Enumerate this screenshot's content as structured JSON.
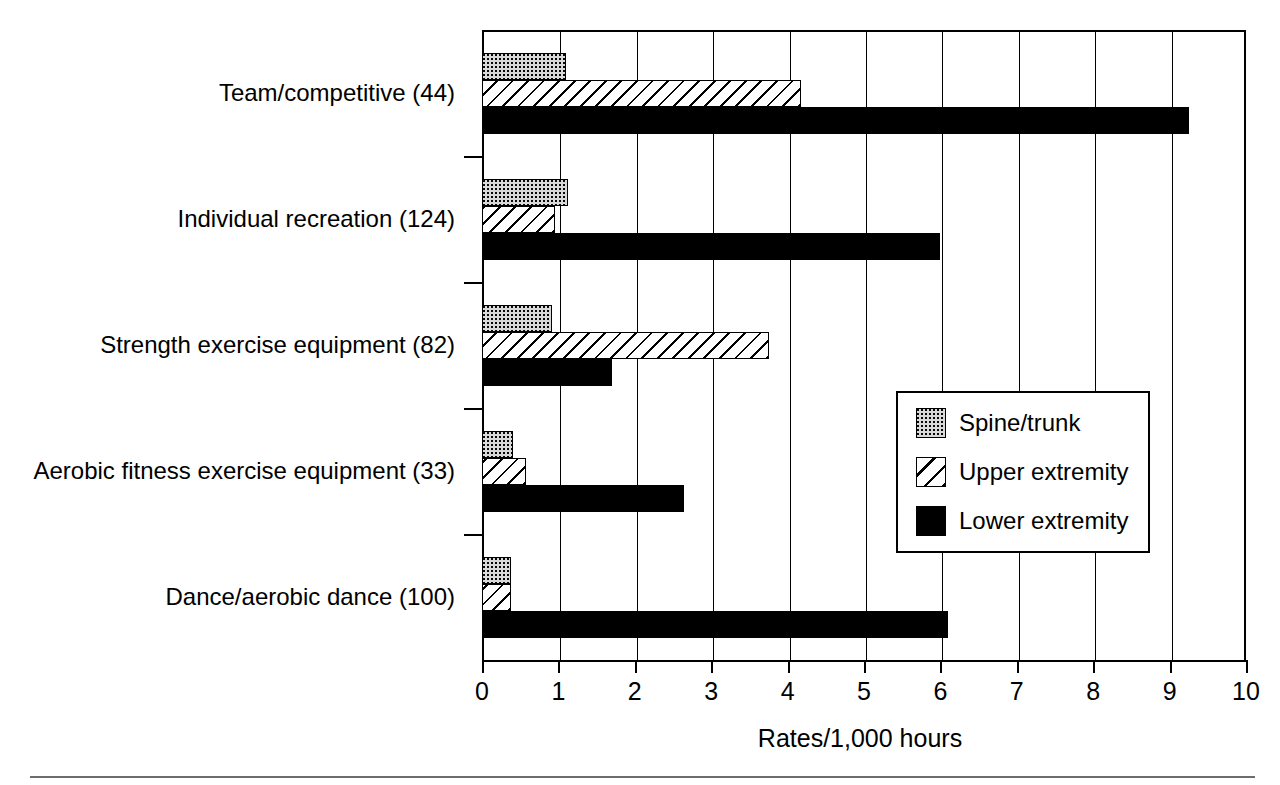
{
  "chart_data": {
    "type": "bar",
    "orientation": "horizontal",
    "title": "",
    "subtitle": "",
    "xlabel": "Rates/1,000 hours",
    "ylabel": "",
    "xlim": [
      0,
      10
    ],
    "xticks": [
      0,
      1,
      2,
      3,
      4,
      5,
      6,
      7,
      8,
      9,
      10
    ],
    "xtick_labels": [
      "0",
      "1",
      "2",
      "3",
      "4",
      "5",
      "6",
      "7",
      "8",
      "9",
      "10"
    ],
    "grid": "vertical gridlines at every integer tick",
    "legend_position": "inside right, middle",
    "categories": [
      "Team/competitive (44)",
      "Individual recreation (124)",
      "Strength exercise equipment (82)",
      "Aerobic fitness exercise equipment (33)",
      "Dance/aerobic dance (100)"
    ],
    "series": [
      {
        "name": "Spine/trunk",
        "pattern": "dotted",
        "color": "#d9d9d9",
        "values": [
          1.1,
          1.13,
          0.92,
          0.4,
          0.38
        ]
      },
      {
        "name": "Upper extremity",
        "pattern": "hatched",
        "color": "#ffffff",
        "values": [
          4.17,
          0.96,
          3.75,
          0.57,
          0.38
        ]
      },
      {
        "name": "Lower extremity",
        "pattern": "solid",
        "color": "#000000",
        "values": [
          9.25,
          6.0,
          1.7,
          2.65,
          6.1
        ]
      }
    ]
  },
  "legend": {
    "items": [
      {
        "label": "Spine/trunk"
      },
      {
        "label": "Upper extremity"
      },
      {
        "label": "Lower extremity"
      }
    ]
  },
  "axis": {
    "x_title": "Rates/1,000 hours",
    "ticks": [
      "0",
      "1",
      "2",
      "3",
      "4",
      "5",
      "6",
      "7",
      "8",
      "9",
      "10"
    ]
  },
  "categories": [
    {
      "label": "Team/competitive (44)"
    },
    {
      "label": "Individual recreation (124)"
    },
    {
      "label": "Strength exercise equipment (82)"
    },
    {
      "label": "Aerobic fitness exercise equipment (33)"
    },
    {
      "label": "Dance/aerobic dance (100)"
    }
  ]
}
